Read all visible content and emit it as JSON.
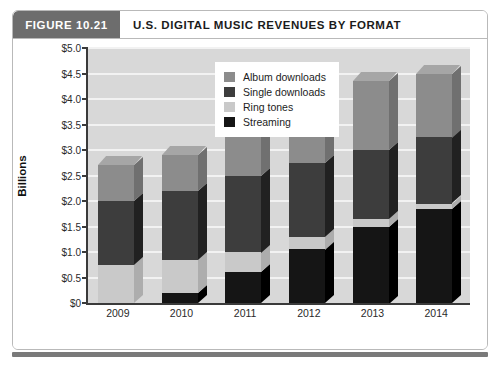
{
  "figure": {
    "number_label": "FIGURE 10.21",
    "title": "U.S. DIGITAL MUSIC REVENUES BY FORMAT"
  },
  "colors": {
    "album_downloads": "#8c8c8c",
    "single_downloads": "#3d3d3d",
    "ring_tones": "#c9c9c9",
    "streaming": "#151515",
    "plot_background": "#d8d8d8",
    "gridline": "#f2f2f2",
    "axis": "#3a3a3a",
    "tab_background": "#6d6d6d"
  },
  "chart_data": {
    "type": "bar",
    "stacked": true,
    "title": "U.S. DIGITAL MUSIC REVENUES BY FORMAT",
    "xlabel": "",
    "ylabel": "Billions",
    "categories": [
      "2009",
      "2010",
      "2011",
      "2012",
      "2013",
      "2014"
    ],
    "ylim": [
      0,
      5.0
    ],
    "ytick_values": [
      0,
      0.5,
      1.0,
      1.5,
      2.0,
      2.5,
      3.0,
      3.5,
      4.0,
      4.5,
      5.0
    ],
    "ytick_labels": [
      "$0",
      "$0.5",
      "$1.0",
      "$1.5",
      "$2.0",
      "$2.5",
      "$3.0",
      "$3.5",
      "$4.0",
      "$4.5",
      "$5.0"
    ],
    "grid": true,
    "legend_position": "top-left-inside",
    "series": [
      {
        "name": "Streaming",
        "values": [
          0.0,
          0.2,
          0.6,
          1.05,
          1.5,
          1.85
        ]
      },
      {
        "name": "Ring tones",
        "values": [
          0.75,
          0.65,
          0.4,
          0.25,
          0.15,
          0.1
        ]
      },
      {
        "name": "Single downloads",
        "values": [
          1.25,
          1.35,
          1.5,
          1.45,
          1.35,
          1.3
        ]
      },
      {
        "name": "Album downloads",
        "values": [
          0.7,
          0.7,
          1.0,
          1.25,
          1.35,
          1.25
        ]
      }
    ],
    "totals": [
      2.7,
      2.9,
      3.5,
      4.0,
      4.35,
      4.5
    ]
  },
  "legend": {
    "items": [
      {
        "label": "Album downloads",
        "color": "#8c8c8c"
      },
      {
        "label": "Single downloads",
        "color": "#3d3d3d"
      },
      {
        "label": "Ring tones",
        "color": "#c9c9c9"
      },
      {
        "label": "Streaming",
        "color": "#151515"
      }
    ]
  }
}
